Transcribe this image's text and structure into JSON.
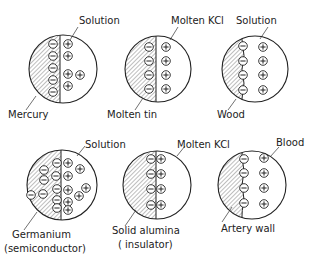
{
  "panels": [
    {
      "id": "mercury-solution",
      "left_label": "Mercury",
      "right_label": "Solution",
      "interface": "straight",
      "left_ions": "negative",
      "right_ions": "positive",
      "negative_count": 5,
      "positive_count": 5
    },
    {
      "id": "molten-tin-kcl",
      "left_label": "Molten tin",
      "right_label": "Molten KCl",
      "interface": "straight",
      "left_ions": "negative",
      "right_ions": "positive",
      "negative_count": 4,
      "positive_count": 4
    },
    {
      "id": "wood-solution",
      "left_label": "Wood",
      "right_label": "Solution",
      "interface": "wavy",
      "left_ions": "negative",
      "right_ions": "positive",
      "negative_count": 4,
      "positive_count": 4
    },
    {
      "id": "germanium-solution",
      "left_label": "Germanium\n(semiconductor)",
      "left_label_line1": "Germanium",
      "left_label_line2": "(semiconductor)",
      "right_label": "Solution",
      "interface": "straight",
      "left_ions": "negative",
      "right_ions": "positive",
      "negative_count": 9,
      "positive_count": 9
    },
    {
      "id": "alumina-kcl",
      "left_label": "Solid alumina\n(insulator)",
      "left_label_line1": "Solid alumina",
      "left_label_line2": "( insulator)",
      "right_label": "Molten KCl",
      "interface": "straight",
      "left_ions": "negative",
      "right_ions": "positive",
      "negative_count": 4,
      "positive_count": 4
    },
    {
      "id": "artery-blood",
      "left_label": "Artery wall",
      "right_label": "Blood",
      "interface": "wavy",
      "left_ions": "negative",
      "right_ions": "positive",
      "negative_count": 4,
      "positive_count": 4
    }
  ],
  "symbols": {
    "negative": "minus-ion-icon",
    "positive": "plus-ion-icon"
  },
  "colors": {
    "line": "#222222",
    "hatch": "#444444",
    "background": "#ffffff"
  }
}
